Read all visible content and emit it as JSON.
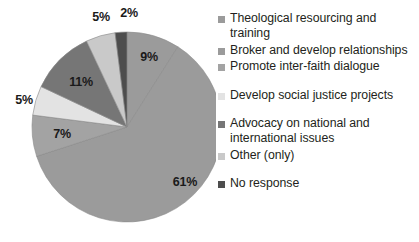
{
  "chart_data": {
    "type": "pie",
    "title": "",
    "xlabel": "",
    "ylabel": "",
    "legend_position": "right",
    "grid": false,
    "start_angle_deg": 0,
    "direction": "clockwise",
    "categories": [
      "Theological resourcing and training",
      "Broker and develop relationships",
      "Promote inter-faith dialogue",
      "Develop social justice projects",
      "Advocacy on national and international issues",
      "Other (only)",
      "No response"
    ],
    "values": [
      9,
      61,
      7,
      5,
      11,
      5,
      2
    ],
    "value_labels": [
      "9%",
      "61%",
      "7%",
      "5%",
      "11%",
      "5%",
      "2%"
    ],
    "colors": [
      "#9b9b9b",
      "#9b9b9b",
      "#a3a3a3",
      "#e3e3e3",
      "#767676",
      "#c9c9c9",
      "#4d4d4d"
    ]
  },
  "slices": [
    {
      "label": "9%",
      "color": "#9b9b9b",
      "value": 9,
      "name": "Theological resourcing and training",
      "label_x": 149,
      "label_y": 57,
      "inside": true
    },
    {
      "label": "61%",
      "color": "#9b9b9b",
      "value": 61,
      "name": "Broker and develop relationships",
      "label_x": 185,
      "label_y": 182,
      "inside": true
    },
    {
      "label": "7%",
      "color": "#a3a3a3",
      "value": 7,
      "name": "Promote inter-faith dialogue",
      "label_x": 62,
      "label_y": 134,
      "inside": true
    },
    {
      "label": "5%",
      "color": "#e3e3e3",
      "value": 5,
      "name": "Develop social justice projects",
      "label_x": 24,
      "label_y": 100,
      "inside": false
    },
    {
      "label": "11%",
      "color": "#767676",
      "value": 11,
      "name": "Advocacy on national and international issues",
      "label_x": 81,
      "label_y": 82,
      "inside": true
    },
    {
      "label": "5%",
      "color": "#c9c9c9",
      "value": 5,
      "name": "Other (only)",
      "label_x": 101,
      "label_y": 17,
      "inside": false
    },
    {
      "label": "2%",
      "color": "#4d4d4d",
      "value": 2,
      "name": "No response",
      "label_x": 129,
      "label_y": 13,
      "inside": false
    }
  ],
  "legend": {
    "items": [
      {
        "label": "Theological resourcing and training",
        "color": "#9b9b9b",
        "gap_before": false
      },
      {
        "label": "Broker and develop relationships",
        "color": "#9b9b9b",
        "gap_before": false
      },
      {
        "label": "Promote inter-faith dialogue",
        "color": "#a3a3a3",
        "gap_before": false
      },
      {
        "label": "Develop social justice projects",
        "color": "#e3e3e3",
        "gap_before": true
      },
      {
        "label": "Advocacy on national and international issues",
        "color": "#767676",
        "gap_before": true
      },
      {
        "label": "Other (only)",
        "color": "#c9c9c9",
        "gap_before": false
      },
      {
        "label": "No response",
        "color": "#4d4d4d",
        "gap_before": true
      }
    ]
  },
  "geometry": {
    "center_x": 127,
    "center_y": 127,
    "radius": 95
  }
}
